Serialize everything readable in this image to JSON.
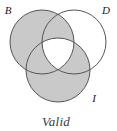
{
  "figure": {
    "type": "venn-diagram-3-set",
    "caption": "Valid",
    "labels": {
      "set_b": "B",
      "set_d": "D",
      "set_i": "I"
    },
    "colors": {
      "shaded_fill": "#c9c9c9",
      "unshaded_fill": "#ffffff",
      "stroke": "#555555",
      "label_color": "#1a1a1a",
      "caption_color": "#3a3a3a",
      "background": "#ffffff"
    },
    "geometry": {
      "circle_b": {
        "cx": 42,
        "cy": 42,
        "r": 32
      },
      "circle_d": {
        "cx": 74,
        "cy": 42,
        "r": 32
      },
      "circle_i": {
        "cx": 58,
        "cy": 70,
        "r": 32
      },
      "stroke_width": 1
    },
    "regions": [
      {
        "name": "B only",
        "shaded": true
      },
      {
        "name": "B and D only",
        "shaded": true
      },
      {
        "name": "D only",
        "shaded": false
      },
      {
        "name": "B and I only",
        "shaded": true
      },
      {
        "name": "B and D and I",
        "shaded": false
      },
      {
        "name": "D and I only",
        "shaded": true
      },
      {
        "name": "I only",
        "shaded": true
      }
    ]
  }
}
